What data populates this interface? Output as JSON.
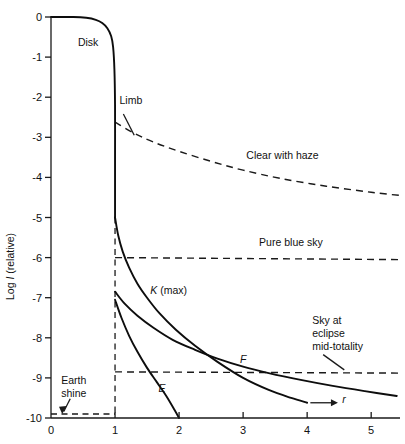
{
  "chart_data": {
    "type": "line",
    "title": "",
    "xlabel": "r",
    "ylabel": "Log I (relative)",
    "ylabel_prefix": "Log ",
    "ylabel_symbol": "I",
    "ylabel_suffix": " (relative)",
    "xlim": [
      0,
      5.45
    ],
    "ylim": [
      -10,
      0
    ],
    "xticks": [
      0,
      1,
      2,
      3,
      4,
      5
    ],
    "xtick_labels": [
      "0",
      "1",
      "2",
      "3",
      "4",
      "5"
    ],
    "yticks": [
      0,
      -1,
      -2,
      -3,
      -4,
      -5,
      -6,
      -7,
      -8,
      -9,
      -10
    ],
    "ytick_labels": [
      "0",
      "-1",
      "-2",
      "-3",
      "-4",
      "-5",
      "-6",
      "-7",
      "-8",
      "-9",
      "-10"
    ],
    "grid": false,
    "legend": "none",
    "series": [
      {
        "name": "Disk and limb profile",
        "style": "solid",
        "points": [
          [
            0.0,
            0.0
          ],
          [
            0.35,
            0.0
          ],
          [
            0.55,
            -0.02
          ],
          [
            0.7,
            -0.07
          ],
          [
            0.8,
            -0.15
          ],
          [
            0.88,
            -0.28
          ],
          [
            0.94,
            -0.48
          ],
          [
            0.97,
            -0.75
          ],
          [
            0.99,
            -1.3
          ],
          [
            1.0,
            -2.2
          ],
          [
            1.0,
            -3.5
          ],
          [
            1.0,
            -4.6
          ],
          [
            1.0,
            -5.0
          ]
        ]
      },
      {
        "name": "K (max)",
        "style": "solid",
        "points": [
          [
            1.0,
            -5.0
          ],
          [
            1.05,
            -5.45
          ],
          [
            1.12,
            -5.85
          ],
          [
            1.22,
            -6.25
          ],
          [
            1.35,
            -6.65
          ],
          [
            1.5,
            -7.0
          ],
          [
            1.7,
            -7.4
          ],
          [
            1.95,
            -7.8
          ],
          [
            2.25,
            -8.2
          ],
          [
            2.6,
            -8.6
          ],
          [
            3.0,
            -9.0
          ],
          [
            3.4,
            -9.3
          ],
          [
            3.75,
            -9.5
          ],
          [
            4.0,
            -9.62
          ]
        ]
      },
      {
        "name": "F",
        "style": "solid",
        "points": [
          [
            1.0,
            -6.85
          ],
          [
            1.15,
            -7.15
          ],
          [
            1.35,
            -7.45
          ],
          [
            1.6,
            -7.75
          ],
          [
            1.9,
            -8.05
          ],
          [
            2.25,
            -8.3
          ],
          [
            2.6,
            -8.52
          ],
          [
            3.0,
            -8.72
          ],
          [
            3.4,
            -8.88
          ],
          [
            3.9,
            -9.05
          ],
          [
            4.4,
            -9.2
          ],
          [
            4.9,
            -9.33
          ],
          [
            5.4,
            -9.45
          ]
        ]
      },
      {
        "name": "E",
        "style": "solid",
        "points": [
          [
            1.0,
            -7.05
          ],
          [
            1.1,
            -7.5
          ],
          [
            1.22,
            -7.95
          ],
          [
            1.35,
            -8.35
          ],
          [
            1.5,
            -8.75
          ],
          [
            1.65,
            -9.1
          ],
          [
            1.8,
            -9.45
          ],
          [
            1.93,
            -9.8
          ],
          [
            2.0,
            -10.0
          ]
        ]
      },
      {
        "name": "Clear with haze",
        "style": "dashed",
        "points": [
          [
            1.0,
            -2.62
          ],
          [
            1.3,
            -2.9
          ],
          [
            1.6,
            -3.12
          ],
          [
            2.0,
            -3.35
          ],
          [
            2.5,
            -3.6
          ],
          [
            3.0,
            -3.82
          ],
          [
            3.6,
            -4.03
          ],
          [
            4.3,
            -4.22
          ],
          [
            5.0,
            -4.37
          ],
          [
            5.45,
            -4.45
          ]
        ]
      },
      {
        "name": "Pure blue sky",
        "style": "dashed",
        "points": [
          [
            1.0,
            -6.0
          ],
          [
            5.45,
            -6.05
          ]
        ]
      },
      {
        "name": "Sky at eclipse mid-totality",
        "style": "dashed",
        "points": [
          [
            1.0,
            -8.85
          ],
          [
            5.45,
            -8.88
          ]
        ]
      },
      {
        "name": "Earth shine",
        "style": "dashed",
        "points": [
          [
            0.0,
            -9.9
          ],
          [
            1.0,
            -9.9
          ]
        ]
      },
      {
        "name": "Limb vertical guide",
        "style": "dashed",
        "points": [
          [
            1.0,
            -5.0
          ],
          [
            1.0,
            -9.9
          ]
        ]
      }
    ],
    "annotations": [
      {
        "key": "disk",
        "text": "Disk",
        "x": 0.42,
        "y": -0.72,
        "italic": false
      },
      {
        "key": "limb",
        "text": "Limb",
        "x": 1.07,
        "y": -2.18,
        "italic": false
      },
      {
        "key": "clear_haze",
        "text": "Clear with haze",
        "x": 3.05,
        "y": -3.55,
        "italic": false
      },
      {
        "key": "pure_blue_sky",
        "text": "Pure blue sky",
        "x": 3.25,
        "y": -5.72,
        "italic": false
      },
      {
        "key": "k_max",
        "text": "K (max)",
        "x": 1.55,
        "y": -6.92,
        "italic": true,
        "italic_part": "K"
      },
      {
        "key": "f_label",
        "text": "F",
        "x": 2.95,
        "y": -8.62,
        "italic": true
      },
      {
        "key": "e_label",
        "text": "E",
        "x": 1.68,
        "y": -9.35,
        "italic": true
      },
      {
        "key": "earth_shine_line1",
        "text": "Earth",
        "x": 0.16,
        "y": -9.15,
        "italic": false
      },
      {
        "key": "earth_shine_line2",
        "text": "shine",
        "x": 0.16,
        "y": -9.48,
        "italic": false
      },
      {
        "key": "sky_eclipse_line1",
        "text": "Sky at",
        "x": 4.08,
        "y": -7.65,
        "italic": false
      },
      {
        "key": "sky_eclipse_line2",
        "text": "eclipse",
        "x": 4.08,
        "y": -7.98,
        "italic": false
      },
      {
        "key": "sky_eclipse_line3",
        "text": "mid-totality",
        "x": 4.08,
        "y": -8.31,
        "italic": false
      },
      {
        "key": "r_axis_label",
        "text": "r",
        "x": 4.55,
        "y": -9.62,
        "italic": true
      }
    ]
  }
}
